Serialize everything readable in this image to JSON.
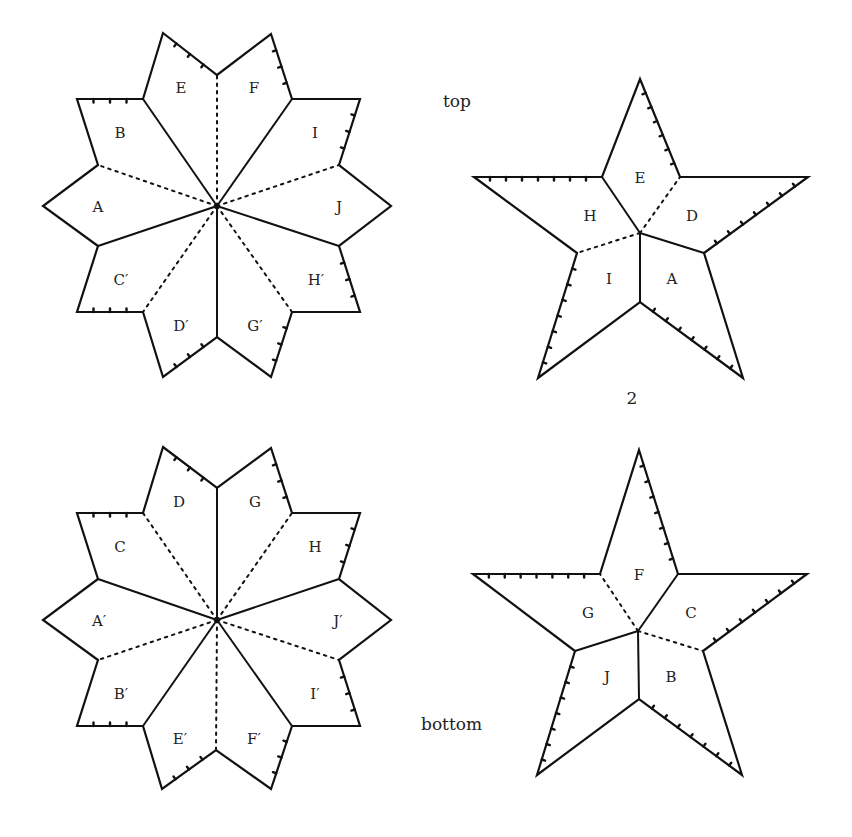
{
  "captions": {
    "top": "top",
    "bottom": "bottom",
    "page_number": "2"
  },
  "top_decagon": {
    "center": [
      217,
      206
    ],
    "outline": [
      [
        163,
        33
      ],
      [
        217,
        75
      ],
      [
        271,
        34
      ],
      [
        292,
        99
      ],
      [
        360,
        99
      ],
      [
        339,
        165
      ],
      [
        391,
        206
      ],
      [
        339,
        246
      ],
      [
        360,
        312
      ],
      [
        292,
        312
      ],
      [
        271,
        377
      ],
      [
        217,
        337
      ],
      [
        163,
        377
      ],
      [
        143,
        312
      ],
      [
        77,
        312
      ],
      [
        98,
        246
      ],
      [
        43,
        206
      ],
      [
        98,
        165
      ],
      [
        77,
        99
      ],
      [
        143,
        99
      ]
    ],
    "folds": [
      {
        "to": [
          217,
          75
        ],
        "style": "dash"
      },
      {
        "to": [
          292,
          99
        ],
        "style": "solid"
      },
      {
        "to": [
          339,
          165
        ],
        "style": "dash"
      },
      {
        "to": [
          339,
          246
        ],
        "style": "solid"
      },
      {
        "to": [
          292,
          312
        ],
        "style": "dash"
      },
      {
        "to": [
          217,
          337
        ],
        "style": "solid"
      },
      {
        "to": [
          143,
          312
        ],
        "style": "dash"
      },
      {
        "to": [
          98,
          246
        ],
        "style": "solid"
      },
      {
        "to": [
          98,
          165
        ],
        "style": "dash"
      },
      {
        "to": [
          143,
          99
        ],
        "style": "solid"
      }
    ],
    "ticked_edges": [
      [
        [
          163,
          33
        ],
        [
          217,
          75
        ]
      ],
      [
        [
          271,
          34
        ],
        [
          292,
          99
        ]
      ],
      [
        [
          360,
          99
        ],
        [
          339,
          165
        ]
      ],
      [
        [
          77,
          99
        ],
        [
          143,
          99
        ]
      ],
      [
        [
          339,
          246
        ],
        [
          360,
          312
        ]
      ],
      [
        [
          77,
          312
        ],
        [
          143,
          312
        ]
      ],
      [
        [
          163,
          377
        ],
        [
          217,
          337
        ]
      ],
      [
        [
          271,
          377
        ],
        [
          292,
          312
        ]
      ]
    ],
    "labels": [
      {
        "text": "E",
        "x": 181,
        "y": 89
      },
      {
        "text": "F",
        "x": 254,
        "y": 89
      },
      {
        "text": "B",
        "x": 120,
        "y": 134
      },
      {
        "text": "I",
        "x": 315,
        "y": 134
      },
      {
        "text": "A",
        "x": 98,
        "y": 208
      },
      {
        "text": "J",
        "x": 339,
        "y": 208
      },
      {
        "text": "C′",
        "x": 121,
        "y": 281
      },
      {
        "text": "H′",
        "x": 316,
        "y": 281
      },
      {
        "text": "D′",
        "x": 181,
        "y": 327
      },
      {
        "text": "G′",
        "x": 255,
        "y": 327
      }
    ]
  },
  "bottom_decagon": {
    "center": [
      217,
      620
    ],
    "outline": [
      [
        163,
        447
      ],
      [
        217,
        488
      ],
      [
        271,
        448
      ],
      [
        292,
        513
      ],
      [
        360,
        513
      ],
      [
        339,
        579
      ],
      [
        391,
        620
      ],
      [
        339,
        660
      ],
      [
        360,
        726
      ],
      [
        292,
        726
      ],
      [
        271,
        789
      ],
      [
        216,
        750
      ],
      [
        162,
        789
      ],
      [
        143,
        726
      ],
      [
        77,
        726
      ],
      [
        98,
        660
      ],
      [
        43,
        620
      ],
      [
        98,
        579
      ],
      [
        77,
        513
      ],
      [
        143,
        513
      ]
    ],
    "folds": [
      {
        "to": [
          217,
          488
        ],
        "style": "solid"
      },
      {
        "to": [
          292,
          513
        ],
        "style": "dash"
      },
      {
        "to": [
          339,
          579
        ],
        "style": "solid"
      },
      {
        "to": [
          339,
          660
        ],
        "style": "dash"
      },
      {
        "to": [
          292,
          726
        ],
        "style": "solid"
      },
      {
        "to": [
          216,
          750
        ],
        "style": "dash"
      },
      {
        "to": [
          143,
          726
        ],
        "style": "solid"
      },
      {
        "to": [
          98,
          660
        ],
        "style": "dash"
      },
      {
        "to": [
          98,
          579
        ],
        "style": "solid"
      },
      {
        "to": [
          143,
          513
        ],
        "style": "dash"
      }
    ],
    "ticked_edges": [
      [
        [
          163,
          447
        ],
        [
          217,
          488
        ]
      ],
      [
        [
          271,
          448
        ],
        [
          292,
          513
        ]
      ],
      [
        [
          360,
          513
        ],
        [
          339,
          579
        ]
      ],
      [
        [
          77,
          513
        ],
        [
          143,
          513
        ]
      ],
      [
        [
          339,
          660
        ],
        [
          360,
          726
        ]
      ],
      [
        [
          77,
          726
        ],
        [
          143,
          726
        ]
      ],
      [
        [
          162,
          789
        ],
        [
          216,
          750
        ]
      ],
      [
        [
          271,
          789
        ],
        [
          292,
          726
        ]
      ]
    ],
    "labels": [
      {
        "text": "D",
        "x": 179,
        "y": 503
      },
      {
        "text": "G",
        "x": 255,
        "y": 503
      },
      {
        "text": "C",
        "x": 120,
        "y": 548
      },
      {
        "text": "H",
        "x": 315,
        "y": 548
      },
      {
        "text": "A′",
        "x": 99,
        "y": 622
      },
      {
        "text": "J′",
        "x": 338,
        "y": 622
      },
      {
        "text": "B′",
        "x": 121,
        "y": 695
      },
      {
        "text": "I′",
        "x": 315,
        "y": 695
      },
      {
        "text": "E′",
        "x": 180,
        "y": 740
      },
      {
        "text": "F′",
        "x": 254,
        "y": 740
      }
    ]
  },
  "top_star": {
    "center": [
      640,
      233
    ],
    "outline": [
      [
        640,
        79
      ],
      [
        680,
        177
      ],
      [
        808,
        177
      ],
      [
        704,
        253
      ],
      [
        743,
        378
      ],
      [
        640,
        302
      ],
      [
        538,
        378
      ],
      [
        577,
        253
      ],
      [
        474,
        177
      ],
      [
        602,
        177
      ]
    ],
    "folds": [
      {
        "from": [
          640,
          233
        ],
        "to": [
          602,
          177
        ],
        "style": "solid"
      },
      {
        "from": [
          640,
          233
        ],
        "to": [
          680,
          177
        ],
        "style": "dash"
      },
      {
        "from": [
          640,
          233
        ],
        "to": [
          704,
          253
        ],
        "style": "solid"
      },
      {
        "from": [
          640,
          233
        ],
        "to": [
          640,
          302
        ],
        "style": "solid"
      },
      {
        "from": [
          640,
          233
        ],
        "to": [
          577,
          253
        ],
        "style": "dash"
      }
    ],
    "ticked_edges": [
      [
        [
          640,
          79
        ],
        [
          680,
          177
        ]
      ],
      [
        [
          474,
          177
        ],
        [
          602,
          177
        ]
      ],
      [
        [
          808,
          177
        ],
        [
          704,
          253
        ]
      ],
      [
        [
          640,
          302
        ],
        [
          743,
          378
        ]
      ],
      [
        [
          577,
          253
        ],
        [
          538,
          378
        ]
      ]
    ],
    "labels": [
      {
        "text": "E",
        "x": 640,
        "y": 179
      },
      {
        "text": "H",
        "x": 590,
        "y": 217
      },
      {
        "text": "D",
        "x": 692,
        "y": 217
      },
      {
        "text": "I",
        "x": 609,
        "y": 280
      },
      {
        "text": "A",
        "x": 672,
        "y": 280
      }
    ]
  },
  "bottom_star": {
    "center": [
      638,
      631
    ],
    "outline": [
      [
        639,
        450
      ],
      [
        678,
        574
      ],
      [
        807,
        574
      ],
      [
        703,
        651
      ],
      [
        742,
        775
      ],
      [
        639,
        699
      ],
      [
        537,
        775
      ],
      [
        575,
        651
      ],
      [
        473,
        574
      ],
      [
        600,
        574
      ]
    ],
    "folds": [
      {
        "from": [
          638,
          631
        ],
        "to": [
          600,
          574
        ],
        "style": "dash"
      },
      {
        "from": [
          638,
          631
        ],
        "to": [
          678,
          574
        ],
        "style": "solid"
      },
      {
        "from": [
          638,
          631
        ],
        "to": [
          703,
          651
        ],
        "style": "dash"
      },
      {
        "from": [
          638,
          631
        ],
        "to": [
          639,
          699
        ],
        "style": "solid"
      },
      {
        "from": [
          638,
          631
        ],
        "to": [
          575,
          651
        ],
        "style": "solid"
      }
    ],
    "ticked_edges": [
      [
        [
          639,
          450
        ],
        [
          678,
          574
        ]
      ],
      [
        [
          473,
          574
        ],
        [
          600,
          574
        ]
      ],
      [
        [
          807,
          574
        ],
        [
          703,
          651
        ]
      ],
      [
        [
          639,
          699
        ],
        [
          742,
          775
        ]
      ],
      [
        [
          575,
          651
        ],
        [
          537,
          775
        ]
      ]
    ],
    "labels": [
      {
        "text": "F",
        "x": 639,
        "y": 576
      },
      {
        "text": "G",
        "x": 588,
        "y": 614
      },
      {
        "text": "C",
        "x": 691,
        "y": 614
      },
      {
        "text": "J",
        "x": 607,
        "y": 678
      },
      {
        "text": "B",
        "x": 671,
        "y": 678
      }
    ]
  }
}
